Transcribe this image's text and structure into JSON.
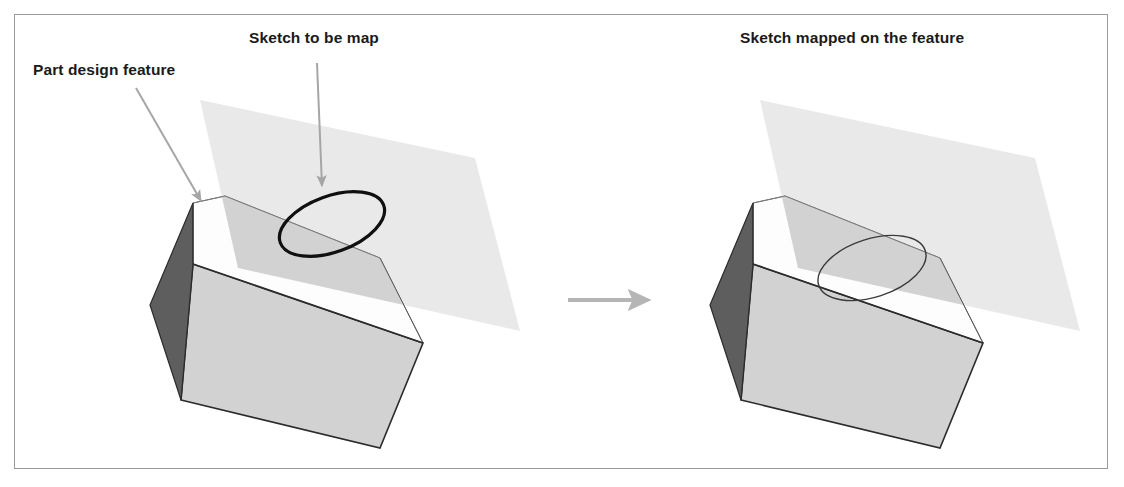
{
  "figure": {
    "border_color": "#9a9a9a",
    "background": "#ffffff"
  },
  "labels": {
    "part_design_feature": "Part design feature",
    "sketch_to_be_map": "Sketch to be map",
    "sketch_mapped_on_feature": "Sketch mapped on the feature"
  },
  "colors": {
    "box_left_face": "#5e5e5e",
    "box_top_face": "#fdfdfd",
    "box_front_face": "#d2d2d2",
    "plane_fill": "#e9e9e9",
    "plane_overlap_fill": "#cfcfcf",
    "sketch_stroke": "#101010",
    "arrow_gray": "#a6a6a6",
    "edge_dark": "#2b2b2b",
    "edge_light": "#8d8d8d",
    "label_text": "#1a1a1a"
  },
  "left_panel": {
    "name": "before-mapping",
    "caption_top": "Sketch to be map",
    "caption_left": "Part design feature",
    "sketch_state": "floating-on-plane",
    "sketch_stroke_width": 3
  },
  "right_panel": {
    "name": "after-mapping",
    "caption_top": "Sketch mapped on the feature",
    "sketch_state": "mapped-on-top-face",
    "sketch_stroke_width": 1.3
  },
  "transition": {
    "name": "transition-arrow",
    "direction": "right",
    "color": "#b5b5b5"
  },
  "callouts": [
    {
      "name": "callout-part-design-feature",
      "from": [
        136,
        88
      ],
      "to": [
        203,
        203
      ]
    },
    {
      "name": "callout-sketch-to-be-map",
      "from": [
        317,
        63
      ],
      "to": [
        322,
        188
      ]
    }
  ]
}
